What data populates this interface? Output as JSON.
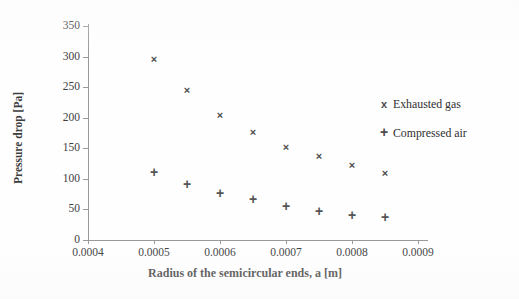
{
  "chart_data": {
    "type": "scatter",
    "title": "",
    "xlabel": "Radius of the semicircular ends, a [m]",
    "ylabel": "Pressure drop [Pa]",
    "xlim": [
      0.0004,
      0.0009
    ],
    "ylim": [
      0,
      350
    ],
    "xticks": [
      "0.0004",
      "0.0005",
      "0.0006",
      "0.0007",
      "0.0008",
      "0.0009"
    ],
    "xtick_values": [
      0.0004,
      0.0005,
      0.0006,
      0.0007,
      0.0008,
      0.0009
    ],
    "yticks": [
      "0",
      "50",
      "100",
      "150",
      "200",
      "250",
      "300",
      "350"
    ],
    "ytick_values": [
      0,
      50,
      100,
      150,
      200,
      250,
      300,
      350
    ],
    "grid": false,
    "legend_position": "right",
    "x": [
      0.0005,
      0.00055,
      0.0006,
      0.00065,
      0.0007,
      0.00075,
      0.0008,
      0.00085
    ],
    "series": [
      {
        "name": "Exhausted gas",
        "marker": "x",
        "color": "#4d4d4d",
        "values": [
          296,
          244,
          204,
          176,
          152,
          136,
          122,
          108
        ]
      },
      {
        "name": "Compressed air",
        "marker": "+",
        "color": "#555555",
        "values": [
          110,
          90,
          76,
          66,
          54,
          46,
          40,
          36
        ]
      }
    ]
  },
  "legend": {
    "items": [
      {
        "marker": "x",
        "label": "Exhausted gas"
      },
      {
        "marker": "+",
        "label": "Compressed air"
      }
    ]
  },
  "axes": {
    "y_title": "Pressure drop [Pa]",
    "x_title": "Radius of the semicircular ends, a [m]"
  },
  "colors": {
    "background": "#fefefe",
    "axis": "#9a9a9a",
    "text": "#3d3d3d",
    "marker": "#4a4a4a"
  }
}
